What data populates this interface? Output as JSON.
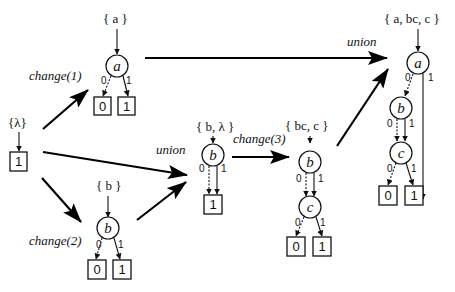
{
  "diagram": {
    "type": "BDD set-operation flow",
    "operations": {
      "change1": "change(1)",
      "change2": "change(2)",
      "change3": "change(3)",
      "union_middle": "union",
      "union_top": "union"
    },
    "graphs": {
      "lambda": {
        "set_label": "{λ}",
        "terminal": "1"
      },
      "a": {
        "set_label": "{ a }",
        "root": "a",
        "edge0": "0",
        "edge1": "1",
        "term0": "0",
        "term1": "1"
      },
      "b": {
        "set_label": "{ b }",
        "root": "b",
        "edge0": "0",
        "edge1": "1",
        "term0": "0",
        "term1": "1"
      },
      "b_lambda": {
        "set_label": "{ b, λ }",
        "root": "b",
        "edge0": "0",
        "edge1": "1",
        "term1": "1"
      },
      "bc_c": {
        "set_label": "{ bc, c }",
        "node_b": "b",
        "node_c": "c",
        "b_edge0": "0",
        "b_edge1": "1",
        "c_edge0": "0",
        "c_edge1": "1",
        "term0": "0",
        "term1": "1"
      },
      "a_bc_c": {
        "set_label": "{ a, bc, c }",
        "node_a": "a",
        "node_b": "b",
        "node_c": "c",
        "a_edge0": "0",
        "a_edge1": "1",
        "b_edge0": "0",
        "b_edge1": "1",
        "c_edge0": "0",
        "c_edge1": "1",
        "term0": "0",
        "term1": "1"
      }
    }
  }
}
